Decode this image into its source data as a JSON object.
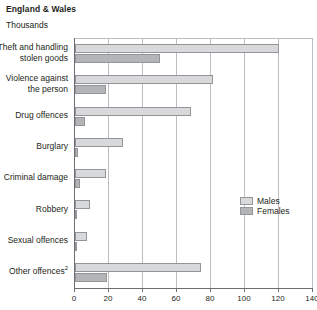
{
  "header": {
    "title": "England & Wales",
    "units": "Thousands"
  },
  "legend": {
    "males_label": "Males",
    "females_label": "Females"
  },
  "chart_data": {
    "type": "bar",
    "orientation": "horizontal",
    "title": "England & Wales",
    "subtitle": "Thousands",
    "xlabel": "",
    "ylabel": "",
    "xlim": [
      0,
      140
    ],
    "xticks": [
      0,
      20,
      40,
      60,
      80,
      100,
      120,
      140
    ],
    "grid": true,
    "legend_position": "right",
    "categories": [
      "Theft and handling stolen goods",
      "Violence against the person",
      "Drug offences",
      "Burglary",
      "Criminal damage",
      "Robbery",
      "Sexual offences",
      "Other offences"
    ],
    "category_lines": [
      [
        "Theft and handling",
        "stolen goods"
      ],
      [
        "Violence against",
        "the person"
      ],
      [
        "Drug offences"
      ],
      [
        "Burglary"
      ],
      [
        "Criminal damage"
      ],
      [
        "Robbery"
      ],
      [
        "Sexual offences"
      ],
      [
        "Other offences"
      ]
    ],
    "category_footnotes": [
      "",
      "",
      "",
      "",
      "",
      "",
      "",
      "2"
    ],
    "series": [
      {
        "name": "Males",
        "color": "#d8d9da",
        "values": [
          120,
          81,
          68,
          28,
          18,
          9,
          7,
          74
        ]
      },
      {
        "name": "Females",
        "color": "#b4b5b7",
        "values": [
          50,
          18,
          6,
          2,
          3,
          1,
          0.3,
          19
        ]
      }
    ]
  }
}
